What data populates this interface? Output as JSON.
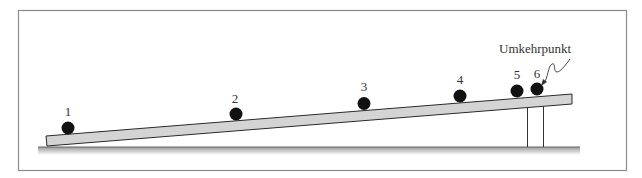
{
  "diagram": {
    "type": "inclined-plane-motion",
    "annotation": "Umkehrpunkt",
    "positions": [
      {
        "label": "1",
        "x": 68,
        "y": 128
      },
      {
        "label": "2",
        "x": 236,
        "y": 114
      },
      {
        "label": "3",
        "x": 364,
        "y": 103
      },
      {
        "label": "4",
        "x": 460,
        "y": 96
      },
      {
        "label": "5",
        "x": 517,
        "y": 91
      },
      {
        "label": "6",
        "x": 537,
        "y": 89
      }
    ],
    "colors": {
      "frame": "#8a8a8a",
      "ramp_fill": "#d4d4d4",
      "ramp_stroke": "#2a2a2a",
      "ball": "#111111",
      "text": "#333333",
      "ground": "#555555"
    }
  }
}
